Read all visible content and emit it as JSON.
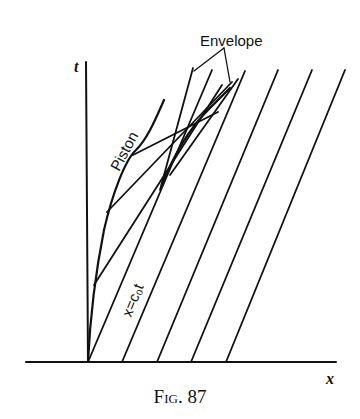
{
  "figure": {
    "caption_prefix": "Fig.",
    "caption_number": "87",
    "labels": {
      "t_axis": "t",
      "x_axis": "x",
      "envelope": "Envelope",
      "piston": "Piston",
      "characteristic": "x=c₀t"
    },
    "colors": {
      "ink": "#111111",
      "background": "#ffffff"
    }
  }
}
